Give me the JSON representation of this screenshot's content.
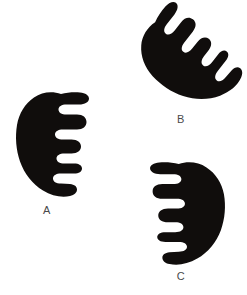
{
  "figure": {
    "background_color": "#ffffff",
    "ink_color": "#100d0c",
    "label_color": "#4a4a4a",
    "width": 247,
    "height": 295,
    "panels": [
      {
        "id": "a",
        "label": "A",
        "shape_name": "comb-silhouette",
        "description": "Solid black crescent silhouette with comb-like finger projections, opening toward the right",
        "orientation_degrees": 0,
        "bbox": {
          "x": 15,
          "y": 91,
          "width": 76,
          "height": 108
        },
        "label_position": {
          "x": 35,
          "y": 204
        },
        "finger_count": 4
      },
      {
        "id": "b",
        "label": "B",
        "shape_name": "comb-silhouette",
        "description": "Solid black crescent silhouette with comb-like finger projections, rotated so the opening faces the upper left",
        "orientation_degrees": -55,
        "bbox": {
          "x": 148,
          "y": 8,
          "width": 80,
          "height": 100
        },
        "label_position": {
          "x": 169,
          "y": 113
        },
        "finger_count": 4
      },
      {
        "id": "c",
        "label": "C",
        "shape_name": "comb-silhouette",
        "description": "Solid black crescent silhouette with comb-like finger projections, mirrored so the opening faces the left",
        "orientation_degrees": 180,
        "bbox": {
          "x": 148,
          "y": 161,
          "width": 78,
          "height": 104
        },
        "label_position": {
          "x": 169,
          "y": 270
        },
        "finger_count": 4
      }
    ]
  }
}
